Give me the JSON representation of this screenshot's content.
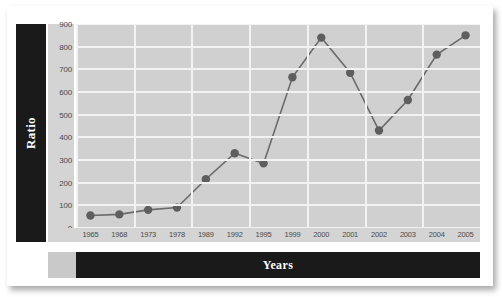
{
  "chart_data": {
    "type": "line",
    "title": "",
    "xlabel": "Years",
    "ylabel": "Ratio",
    "categories": [
      "1965",
      "1968",
      "1973",
      "1978",
      "1989",
      "1992",
      "1995",
      "1999",
      "2000",
      "2001",
      "2002",
      "2003",
      "2004",
      "2005"
    ],
    "values": [
      55,
      60,
      80,
      90,
      215,
      330,
      285,
      665,
      840,
      685,
      430,
      565,
      765,
      850
    ],
    "ylim": [
      0,
      900
    ],
    "ytick_labels": [
      "0",
      "100",
      "200",
      "300",
      "400",
      "500",
      "600",
      "700",
      "800",
      "900"
    ],
    "ytick_values": [
      0,
      100,
      200,
      300,
      400,
      500,
      600,
      700,
      800,
      900
    ],
    "grid": true,
    "legend": "none",
    "marker": "circle",
    "series_color": "#6b6b6b",
    "marker_color": "#5e5e5e",
    "plot_background": "#d0d0d0",
    "gridline_color": "#f2f2f2",
    "panel_color": "#1a1a1a",
    "panel_text_color": "#ffffff"
  }
}
